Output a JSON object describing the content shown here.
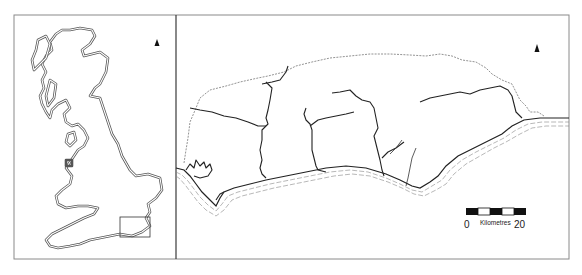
{
  "figure": {
    "overview_panel": {
      "name": "Great Britain overview",
      "inset_box": {
        "x": 120,
        "y": 217,
        "width": 30,
        "height": 20
      },
      "north_arrow": true
    },
    "detail_panel": {
      "name": "Study area detail (south coast)",
      "north_arrow": true,
      "features": [
        "county boundary (dashed)",
        "rivers",
        "coastline with sea hatching"
      ]
    },
    "scale_bar": {
      "start_label": "0",
      "unit_label": "Kilometres",
      "end_label": "20",
      "segments": [
        "black",
        "white",
        "black",
        "white",
        "black"
      ]
    },
    "colors": {
      "line": "#222222",
      "boundary": "#777777",
      "frame": "#8a8a8a",
      "background": "#ffffff"
    }
  }
}
